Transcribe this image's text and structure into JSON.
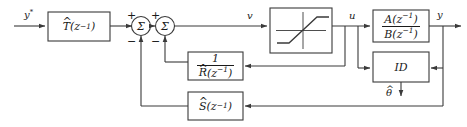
{
  "diagram": {
    "stroke_color": "#3a3a3a",
    "text_color": "#1a1a1a",
    "background": "#ffffff"
  },
  "signals": {
    "reference": "y",
    "reference_star": "*",
    "v": "v",
    "u": "u",
    "y": "y",
    "theta_hat": "θ",
    "theta_hat_mark": "^"
  },
  "blocks": {
    "tracking": {
      "name": "T-hat",
      "hat": "^",
      "base": "T",
      "arg": "(z",
      "exp": "−1",
      "argclose": ")"
    },
    "saturation": {
      "name": "saturation-nonlinearity",
      "label": ""
    },
    "plant": {
      "name": "plant-transfer-function",
      "num_base": "A",
      "num_arg": "(z",
      "num_exp": "−1",
      "num_close": ")",
      "den_base": "B",
      "den_arg": "(z",
      "den_exp": "−1",
      "den_close": ")"
    },
    "identifier": {
      "name": "ID",
      "label": "ID"
    },
    "r_feedback": {
      "name": "one-over-R-hat",
      "numerator": "1",
      "hat": "^",
      "base": "R",
      "arg": "(z",
      "exp": "−1",
      "argclose": ")"
    },
    "s_feedback": {
      "name": "S-hat",
      "hat": "^",
      "base": "S",
      "arg": "(z",
      "exp": "−1",
      "argclose": ")"
    }
  },
  "summers": {
    "first": {
      "symbol": "Σ",
      "plus": "+",
      "minus": "−"
    },
    "second": {
      "symbol": "Σ",
      "plus": "+",
      "minus": "−"
    }
  }
}
